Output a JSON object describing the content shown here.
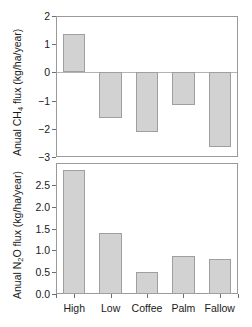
{
  "figure": {
    "categories": [
      "High",
      "Low",
      "Coffee",
      "Palm",
      "Fallow"
    ],
    "caption_fragment": ""
  },
  "chart_data": [
    {
      "type": "bar",
      "panel": "top",
      "title": "",
      "xlabel": "",
      "ylabel": "Anual CH4 flux (kg/ha/year)",
      "ylabel_parts": {
        "pre": "Anual CH",
        "sub": "4",
        "post": " flux (kg/ha/year)"
      },
      "categories": [
        "High",
        "Low",
        "Coffee",
        "Palm",
        "Fallow"
      ],
      "values": [
        1.35,
        -1.6,
        -2.12,
        -1.15,
        -2.63
      ],
      "ylim": [
        -3,
        2
      ],
      "yticks": [
        2,
        1,
        0,
        -1,
        -2,
        -3
      ],
      "ytick_labels": [
        "2",
        "1",
        "0",
        "−1",
        "−2",
        "−3"
      ],
      "grid": false,
      "legend": "none",
      "zero_line": true,
      "bar_fill": "#d2d2d2",
      "bar_stroke": "#9f9f9f"
    },
    {
      "type": "bar",
      "panel": "bottom",
      "title": "",
      "xlabel": "",
      "ylabel": "Anual N2O flux (kg/ha/year)",
      "ylabel_parts": {
        "pre": "Anual N",
        "sub": "2",
        "post": "O flux (kg/ha/year)"
      },
      "categories": [
        "High",
        "Low",
        "Coffee",
        "Palm",
        "Fallow"
      ],
      "values": [
        2.83,
        1.4,
        0.51,
        0.86,
        0.8
      ],
      "ylim": [
        0,
        3.0
      ],
      "yticks": [
        2.5,
        2.0,
        1.5,
        1.0,
        0.5,
        0.0
      ],
      "ytick_labels": [
        "2.5",
        "2.0",
        "1.5",
        "1.0",
        "0.5",
        "0.0"
      ],
      "grid": false,
      "legend": "none",
      "zero_line": false,
      "bar_fill": "#d2d2d2",
      "bar_stroke": "#9f9f9f"
    }
  ]
}
